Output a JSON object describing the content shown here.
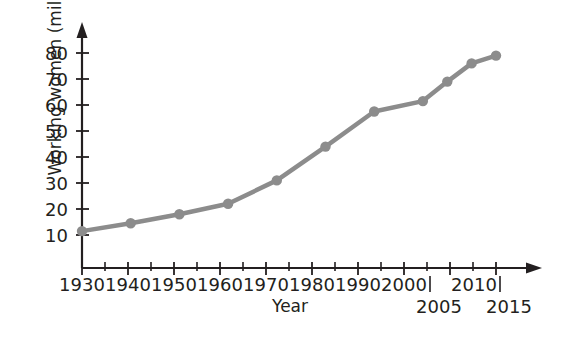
{
  "chart_data": {
    "type": "line",
    "title": "",
    "xlabel": "Year",
    "ylabel": "Working women (millions)",
    "x": [
      1930,
      1940,
      1950,
      1960,
      1970,
      1980,
      1990,
      2000,
      2005,
      2010,
      2015
    ],
    "values": [
      11.5,
      14.5,
      18,
      22,
      31,
      44,
      57.5,
      61.5,
      69,
      76,
      79
    ],
    "series": [
      {
        "name": "Working women (millions)",
        "values": [
          11.5,
          14.5,
          18,
          22,
          31,
          44,
          57.5,
          61.5,
          69,
          76,
          79
        ]
      }
    ],
    "xlim": [
      1930,
      2015
    ],
    "ylim": [
      0,
      85
    ],
    "y_ticks": [
      10,
      20,
      30,
      40,
      50,
      60,
      70,
      80
    ],
    "x_ticks": [
      1930,
      1940,
      1950,
      1960,
      1970,
      1980,
      1990,
      2000,
      2010
    ],
    "x_ticks_secondary": [
      2005,
      2015
    ],
    "x_minor_ticks": [
      1935,
      1945,
      1955,
      1965,
      1975,
      1985,
      1995,
      2005,
      2015
    ],
    "grid": false,
    "legend": false,
    "legend_position": "none",
    "marker": "circle",
    "line_color": "#8c8c8c",
    "marker_color": "#8c8c8c",
    "axis_color": "#231f20",
    "background_color": "#ffffff",
    "axis_arrows": true
  },
  "axes": {
    "y_tick_labels": [
      "80",
      "70",
      "60",
      "50",
      "40",
      "30",
      "20",
      "10"
    ],
    "x_tick_labels": [
      "1930",
      "1940",
      "1950",
      "1960",
      "1970",
      "1980",
      "1990",
      "2000",
      "2010"
    ],
    "x_tick_labels_secondary": [
      "2005",
      "2015"
    ],
    "x_title": "Year",
    "y_title": "Working women (millions)"
  }
}
